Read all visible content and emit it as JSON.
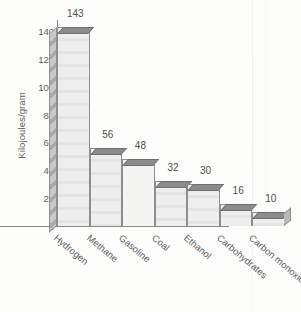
{
  "chart_data": {
    "type": "bar",
    "title": "",
    "xlabel": "",
    "ylabel": "Kilojoules/gram",
    "categories": [
      "Hydrogen",
      "Methane",
      "Gasoline",
      "Coal",
      "Ethanol",
      "Carbohydrates",
      "Carbon monoxide"
    ],
    "values": [
      143,
      56,
      48,
      32,
      30,
      16,
      10
    ],
    "value_labels": [
      "143",
      "56",
      "48",
      "32",
      "30",
      "16",
      "10"
    ],
    "ylim": [
      0,
      148
    ],
    "yticks": [
      0,
      20,
      40,
      60,
      80,
      100,
      120,
      140
    ],
    "ytick_labels": [
      "0",
      "20",
      "40",
      "60",
      "80",
      "100",
      "120",
      "140"
    ],
    "grid": true,
    "legend": false,
    "style": "3d-bar",
    "colors": {
      "bar_face": "#eeeeee",
      "bar_top": "#8c8c8c",
      "bar_side": "#b9b9b9",
      "bar_outline": "#8e8e8e",
      "axis": "#8a8a8a",
      "text": "#5d5d5d",
      "background": "#fdfdfc"
    }
  }
}
